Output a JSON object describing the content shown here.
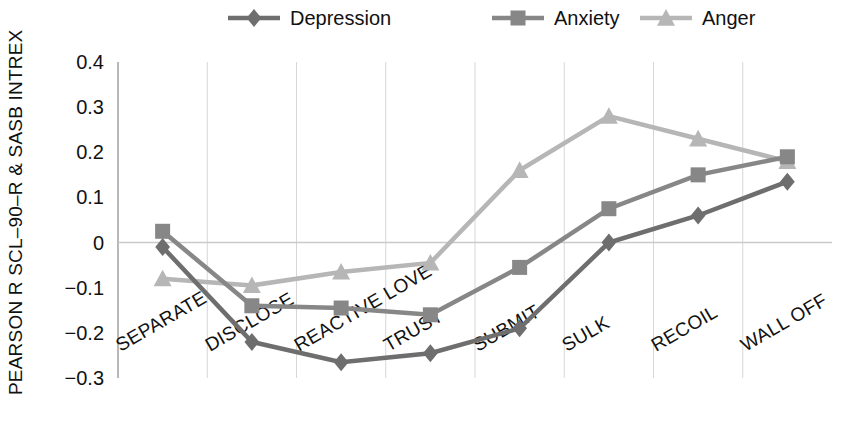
{
  "chart_data": {
    "type": "line",
    "title": "",
    "xlabel": "",
    "ylabel": "PEARSON R SCL–90–R & SASB INTREX",
    "categories": [
      "SEPARATE",
      "DISCLOSE",
      "REACTIVE LOVE",
      "TRUST",
      "SUBMIT",
      "SULK",
      "RECOIL",
      "WALL OFF"
    ],
    "ylim": [
      -0.3,
      0.4
    ],
    "yticks": [
      0.4,
      0.3,
      0.2,
      0.1,
      0,
      -0.1,
      -0.2,
      -0.3
    ],
    "ytick_labels": [
      "0.4",
      "0.3",
      "0.2",
      "0.1",
      "0",
      "−0.1",
      "−0.2",
      "−0.3"
    ],
    "grid": true,
    "legend_position": "top",
    "series": [
      {
        "name": "Depression",
        "marker": "diamond",
        "color": "#6e6e6e",
        "values": [
          -0.01,
          -0.22,
          -0.265,
          -0.245,
          -0.19,
          0.0,
          0.06,
          0.135
        ]
      },
      {
        "name": "Anxiety",
        "marker": "square",
        "color": "#878787",
        "values": [
          0.025,
          -0.14,
          -0.145,
          -0.16,
          -0.055,
          0.075,
          0.15,
          0.19
        ]
      },
      {
        "name": "Anger",
        "marker": "triangle",
        "color": "#b6b6b6",
        "values": [
          -0.08,
          -0.095,
          -0.065,
          -0.045,
          0.16,
          0.28,
          0.23,
          0.18
        ]
      }
    ]
  },
  "legend": {
    "items": [
      {
        "label": "Depression"
      },
      {
        "label": "Anxiety"
      },
      {
        "label": "Anger"
      }
    ]
  },
  "axes": {
    "y_axis_title": "PEARSON R SCL–90–R & SASB INTREX"
  }
}
